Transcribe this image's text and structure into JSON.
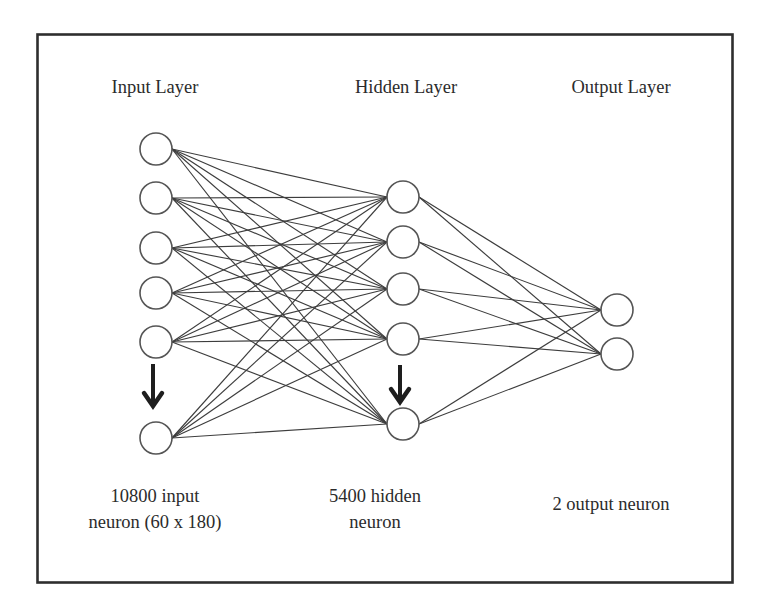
{
  "colors": {
    "frame": "#2e2e2e",
    "edge": "#3d3d3d",
    "node_stroke": "#555555",
    "node_fill": "#ffffff",
    "arrow": "#1e1e1e",
    "text": "#2b2b2b"
  },
  "layers": {
    "input": {
      "title": "Input Layer",
      "caption_line1": "10800 input",
      "caption_line2": "neuron (60 x 180)"
    },
    "hidden": {
      "title": "Hidden Layer",
      "caption_line1": "5400 hidden",
      "caption_line2": "neuron"
    },
    "output": {
      "title": "Output Layer",
      "caption_line1": "2 output neuron"
    }
  },
  "geometry": {
    "node_radius": 16,
    "input_x": 156,
    "input_y": [
      149,
      198,
      248,
      293,
      342,
      438
    ],
    "hidden_x": 403,
    "hidden_y": [
      197,
      242,
      289,
      339,
      424
    ],
    "output_x": 617,
    "output_y": [
      310,
      354
    ],
    "input_arrow": {
      "x": 153,
      "y1": 364,
      "y2": 406
    },
    "hidden_arrow": {
      "x": 400,
      "y1": 365,
      "y2": 402
    }
  }
}
